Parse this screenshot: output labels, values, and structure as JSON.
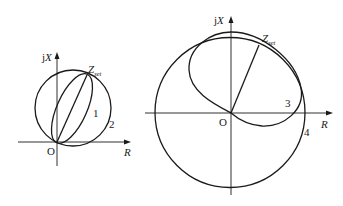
{
  "figure": {
    "left_diagram": {
      "axis_y_label_prefix": "j",
      "axis_y_label_var": "X",
      "axis_x_label": "R",
      "origin_label": "O",
      "point_label_main": "Z",
      "point_label_sub": "set",
      "curve_labels": [
        "1",
        "2"
      ],
      "curves": [
        {
          "id": "1",
          "shape": "lens/ellipse through O and Zset"
        },
        {
          "id": "2",
          "shape": "circle with O-Zset chord"
        }
      ]
    },
    "right_diagram": {
      "axis_y_label_prefix": "j",
      "axis_y_label_var": "X",
      "axis_x_label": "R",
      "origin_label": "O",
      "point_label_main": "Z",
      "point_label_sub": "set",
      "curve_labels": [
        "3",
        "4"
      ],
      "curves": [
        {
          "id": "3",
          "shape": "offset ellipse through O and Zset"
        },
        {
          "id": "4",
          "shape": "circle centered at origin"
        }
      ]
    }
  }
}
